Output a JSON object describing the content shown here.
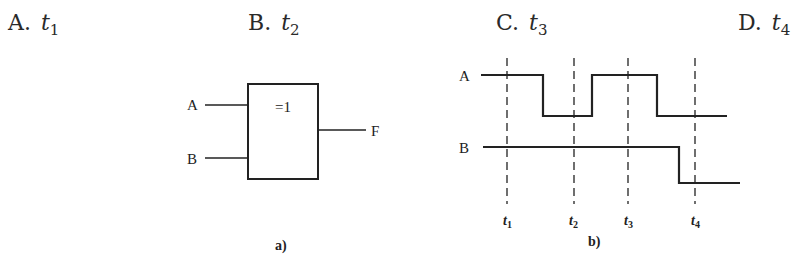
{
  "options": [
    {
      "letter": "A.",
      "var": "t",
      "sub": "1"
    },
    {
      "letter": "B.",
      "var": "t",
      "sub": "2"
    },
    {
      "letter": "C.",
      "var": "t",
      "sub": "3"
    },
    {
      "letter": "D.",
      "var": "t",
      "sub": "4"
    }
  ],
  "gate": {
    "symbol": "=1",
    "input_a": "A",
    "input_b": "B",
    "output": "F",
    "caption": "a)"
  },
  "timing": {
    "signal_a": "A",
    "signal_b": "B",
    "markers": [
      {
        "var": "t",
        "sub": "1"
      },
      {
        "var": "t",
        "sub": "2"
      },
      {
        "var": "t",
        "sub": "3"
      },
      {
        "var": "t",
        "sub": "4"
      }
    ],
    "caption": "b)"
  }
}
